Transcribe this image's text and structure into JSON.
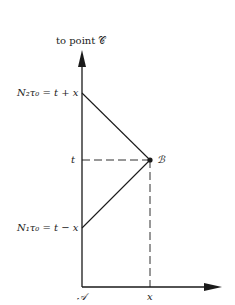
{
  "diagram": {
    "top_label": "to point 𝒞",
    "y_labels": {
      "upper": "N₂τ₀ = t + x",
      "middle": "t",
      "lower": "N₁τ₀ = t − x"
    },
    "origin_label": "𝒜",
    "x_label": "x",
    "point_label": "ℬ",
    "colors": {
      "line": "#1a1a1a",
      "background": "#ffffff"
    },
    "geometry": {
      "origin": [
        82,
        287
      ],
      "y_axis_top": [
        82,
        52
      ],
      "x_axis_end": [
        222,
        287
      ],
      "upper_point": [
        82,
        93
      ],
      "middle_y": 160,
      "lower_point": [
        82,
        228
      ],
      "point_B": [
        150,
        160
      ],
      "x_tick": 150
    }
  }
}
